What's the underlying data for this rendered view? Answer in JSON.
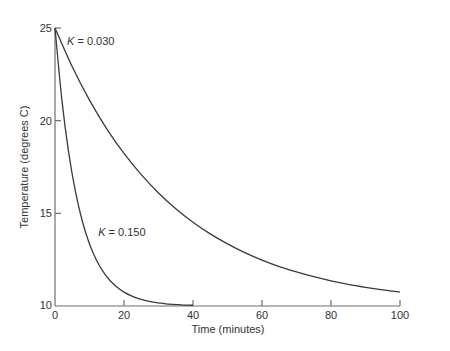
{
  "chart_data": {
    "type": "line",
    "title": "",
    "xlabel": "Time (minutes)",
    "ylabel": "Temperature (degrees C)",
    "xlim": [
      0,
      100
    ],
    "ylim": [
      10,
      25
    ],
    "xticks": [
      0,
      20,
      40,
      60,
      80,
      100
    ],
    "yticks": [
      10,
      15,
      20,
      25
    ],
    "grid": false,
    "legend": "none (inline curve annotations)",
    "series": [
      {
        "name": "K = 0.030",
        "label_var": "K",
        "label_value": "= 0.030",
        "x": [
          0,
          5,
          10,
          15,
          20,
          25,
          30,
          35,
          40,
          45,
          50,
          55,
          60,
          65,
          70,
          75,
          80,
          85,
          90,
          95,
          100
        ],
        "y": [
          25.0,
          22.91,
          21.11,
          19.56,
          18.23,
          17.09,
          16.1,
          15.25,
          14.52,
          13.89,
          13.35,
          12.88,
          12.48,
          12.13,
          11.84,
          11.58,
          11.36,
          11.17,
          11.01,
          10.87,
          10.75
        ]
      },
      {
        "name": "K = 0.150",
        "label_var": "K",
        "label_value": "= 0.150",
        "x": [
          0,
          2,
          4,
          6,
          8,
          10,
          12,
          14,
          16,
          18,
          20,
          22,
          24,
          26,
          28,
          30,
          32,
          34,
          36,
          38,
          40
        ],
        "y": [
          25.0,
          21.11,
          18.23,
          16.1,
          14.52,
          13.35,
          12.48,
          11.84,
          11.36,
          11.01,
          10.75,
          10.56,
          10.41,
          10.3,
          10.22,
          10.17,
          10.12,
          10.09,
          10.07,
          10.05,
          10.04
        ]
      }
    ],
    "annotations": [
      {
        "text": "K = 0.030",
        "x": 3.5,
        "y": 24.1
      },
      {
        "text": "K = 0.150",
        "x": 12.5,
        "y": 13.8
      }
    ]
  },
  "colors": {
    "line": "#3a3a3a",
    "axis": "#6e6e6e",
    "text": "#333333",
    "background": "#ffffff"
  }
}
